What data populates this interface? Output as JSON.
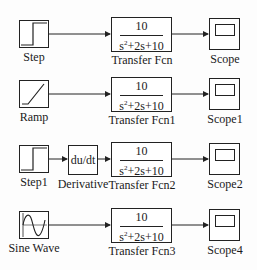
{
  "diagram": {
    "type": "simulink-model",
    "rows": [
      {
        "source": {
          "label": "Step",
          "icon": "step-icon"
        },
        "transfer_fcn": {
          "label": "Transfer Fcn",
          "numerator": "10",
          "denominator_s2": "s",
          "denominator_rest": "+2s+10"
        },
        "scope": {
          "label": "Scope",
          "icon": "scope-icon"
        }
      },
      {
        "source": {
          "label": "Ramp",
          "icon": "ramp-icon"
        },
        "transfer_fcn": {
          "label": "Transfer Fcn1",
          "numerator": "10",
          "denominator_s2": "s",
          "denominator_rest": "+2s+10"
        },
        "scope": {
          "label": "Scope1",
          "icon": "scope-icon"
        }
      },
      {
        "source": {
          "label": "Step1",
          "icon": "step-icon"
        },
        "derivative": {
          "label": "Derivative",
          "text": "du/dt"
        },
        "transfer_fcn": {
          "label": "Transfer Fcn2",
          "numerator": "10",
          "denominator_s2": "s",
          "denominator_rest": "+2s+10"
        },
        "scope": {
          "label": "Scope2",
          "icon": "scope-icon"
        }
      },
      {
        "source": {
          "label": "Sine Wave",
          "icon": "sine-wave-icon"
        },
        "transfer_fcn": {
          "label": "Transfer Fcn3",
          "numerator": "10",
          "denominator_s2": "s",
          "denominator_rest": "+2s+10"
        },
        "scope": {
          "label": "Scope4",
          "icon": "scope-icon"
        }
      }
    ],
    "superscript": "2"
  }
}
